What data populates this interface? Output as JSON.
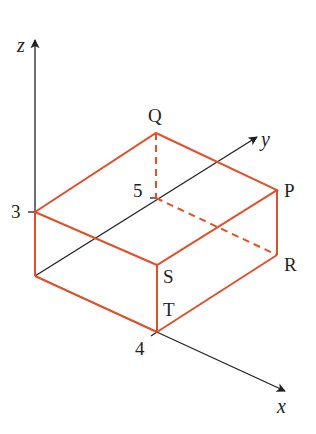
{
  "figure": {
    "colors": {
      "edge": "#e0502a",
      "axis": "#231f20",
      "text": "#231f20"
    },
    "axes": {
      "x": {
        "label": "x"
      },
      "y": {
        "label": "y"
      },
      "z": {
        "label": "z"
      }
    },
    "ticks": {
      "z": "3",
      "x": "4",
      "y": "5"
    },
    "vertices": {
      "P": "P",
      "Q": "Q",
      "R": "R",
      "S": "S",
      "T": "T"
    },
    "dimensions": {
      "x": 4,
      "y": 5,
      "z": 3
    }
  }
}
